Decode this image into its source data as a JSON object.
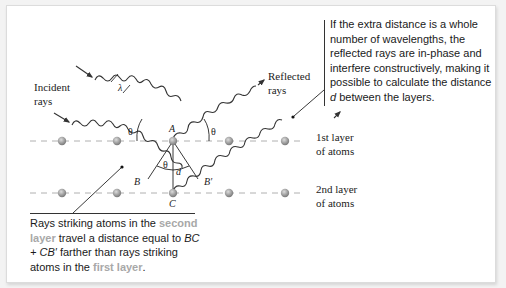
{
  "figure": {
    "labels": {
      "incident": [
        "Incident",
        "rays"
      ],
      "reflected": [
        "Reflected",
        "rays"
      ],
      "layer1": [
        "1st layer",
        "of atoms"
      ],
      "layer2": [
        "2nd layer",
        "of atoms"
      ],
      "wavelength": "λ",
      "theta": "θ",
      "point_a": "A",
      "point_b": "B",
      "point_b_prime": "B′",
      "point_c": "C",
      "spacing": "d"
    },
    "callout_top": {
      "pre": "If the extra distance is a whole number of wavelengths, the reflected rays are in-phase and interfere constructively, making it possible to calculate the distance ",
      "var": "d",
      "post": " between the layers."
    },
    "callout_bottom": {
      "t1": "Rays striking atoms in the ",
      "h1": "second layer",
      "t2": " travel a distance equal to ",
      "expr": "BC + CB′",
      "t3": " farther than rays striking atoms in the ",
      "h2": "first layer",
      "t4": "."
    },
    "colors": {
      "highlight_text": "#a8a8a8",
      "atom": "#9a9a9a",
      "layer_line": "#b0b0b0",
      "ray": "#333333"
    }
  }
}
